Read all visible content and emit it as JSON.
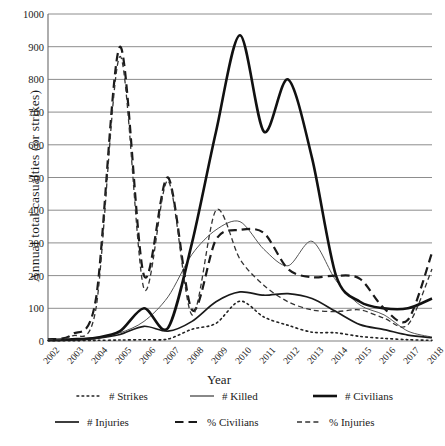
{
  "chart_data": {
    "type": "line",
    "title": "",
    "xlabel": "Year",
    "ylabel": "Annual total casualties (or strikes)",
    "ylim": [
      0,
      1000
    ],
    "ytick_step": 100,
    "yticks": [
      1000,
      900,
      800,
      700,
      600,
      500,
      400,
      300,
      200,
      100,
      0
    ],
    "grid": true,
    "legend_position": "bottom",
    "categories": [
      "2002",
      "2003",
      "2004",
      "2005",
      "2006",
      "2007",
      "2008",
      "2009",
      "2010",
      "2011",
      "2012",
      "2013",
      "2014",
      "2015",
      "2016",
      "2017",
      "2018"
    ],
    "series": [
      {
        "name": "# Strikes",
        "style": "dotted",
        "color": "#222222",
        "width": 1.6,
        "values": [
          1,
          1,
          2,
          3,
          4,
          6,
          36,
          54,
          122,
          73,
          48,
          27,
          25,
          14,
          8,
          4,
          2
        ]
      },
      {
        "name": "# Killed",
        "style": "solid-thin",
        "color": "#555555",
        "width": 1.0,
        "values": [
          3,
          5,
          10,
          25,
          60,
          135,
          265,
          340,
          365,
          280,
          230,
          305,
          185,
          110,
          80,
          30,
          12
        ]
      },
      {
        "name": "# Civilians",
        "style": "solid-thick",
        "color": "#111111",
        "width": 2.6,
        "values": [
          3,
          5,
          10,
          30,
          100,
          40,
          300,
          640,
          935,
          640,
          800,
          560,
          200,
          120,
          100,
          100,
          130
        ]
      },
      {
        "name": "# Injuries",
        "style": "solid-medium",
        "color": "#1a1a1a",
        "width": 1.7,
        "values": [
          2,
          3,
          8,
          20,
          45,
          30,
          60,
          120,
          150,
          140,
          145,
          130,
          90,
          50,
          35,
          18,
          10
        ]
      },
      {
        "name": "% Civilians",
        "style": "long-dash",
        "color": "#1a1a1a",
        "width": 2.2,
        "values": [
          5,
          20,
          130,
          900,
          200,
          500,
          95,
          310,
          340,
          330,
          220,
          195,
          200,
          190,
          100,
          65,
          270
        ]
      },
      {
        "name": "% Injuries",
        "style": "dash",
        "color": "#333333",
        "width": 1.3,
        "values": [
          4,
          15,
          100,
          870,
          160,
          490,
          80,
          400,
          250,
          170,
          120,
          95,
          90,
          95,
          70,
          50,
          220
        ]
      }
    ]
  },
  "axis": {
    "ylabel": "Annual total casualties (or strikes)",
    "xlabel": "Year"
  },
  "legend": {
    "items": [
      {
        "label": "# Strikes",
        "style": "dotted"
      },
      {
        "label": "# Killed",
        "style": "solid-thin"
      },
      {
        "label": "# Civilians",
        "style": "solid-thick"
      },
      {
        "label": "# Injuries",
        "style": "solid-medium"
      },
      {
        "label": "% Civilians",
        "style": "long-dash"
      },
      {
        "label": "% Injuries",
        "style": "dash"
      }
    ]
  },
  "colors": {
    "grid": "#808080",
    "axis": "#6b6b6b",
    "ink": "#1a1a1a",
    "background": "#ffffff"
  }
}
